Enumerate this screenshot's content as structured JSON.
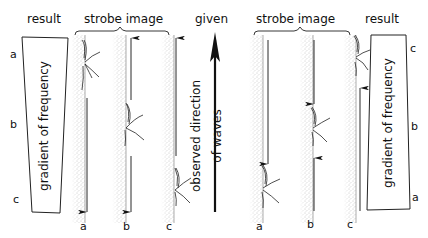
{
  "left_panel": {
    "result_title": "result",
    "strobe_title": "strobe image",
    "result_box_label": "gradient of frequency",
    "side_labels": [
      "a",
      "b",
      "c"
    ],
    "strip_labels": [
      "a",
      "b",
      "c"
    ],
    "arrows": [
      {
        "strip": "a",
        "direction": "down"
      },
      {
        "strip": "b",
        "direction": "up"
      },
      {
        "strip": "b",
        "direction": "down"
      },
      {
        "strip": "c",
        "direction": "up"
      }
    ]
  },
  "center": {
    "title": "given",
    "arrow_label_line1": "observed direction",
    "arrow_label_line2": "of waves",
    "arrow_direction": "up"
  },
  "right_panel": {
    "strobe_title": "strobe image",
    "result_title": "result",
    "result_box_label": "gradient of frequency",
    "side_labels": [
      "c",
      "b",
      "a"
    ],
    "strip_labels": [
      "a",
      "b",
      "c"
    ],
    "arrows": [
      {
        "strip": "a",
        "direction": "down"
      },
      {
        "strip": "b",
        "direction": "down"
      },
      {
        "strip": "b",
        "direction": "up"
      },
      {
        "strip": "c",
        "direction": "up"
      }
    ]
  },
  "colors": {
    "ink": "#111111",
    "stipple": "#9a9a9a",
    "background": "#ffffff"
  }
}
